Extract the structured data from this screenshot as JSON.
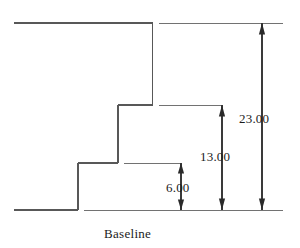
{
  "drawing": {
    "type": "engineering-dimension-drawing",
    "title": "",
    "baseline_label": "Baseline",
    "stroke_color": "#555555",
    "dimension_color": "#333333",
    "text_color": "#1b1b1b",
    "background_color": "#ffffff",
    "dimensions": [
      {
        "id": "dim-23",
        "label": "23.00",
        "value": 23.0,
        "unit": "",
        "orientation": "vertical",
        "from": "baseline",
        "to": "top-face"
      },
      {
        "id": "dim-13",
        "label": "13.00",
        "value": 13.0,
        "unit": "",
        "orientation": "vertical",
        "from": "baseline",
        "to": "upper-step-face"
      },
      {
        "id": "dim-6",
        "label": "6.00",
        "value": 6.0,
        "unit": "",
        "orientation": "vertical",
        "from": "baseline",
        "to": "lower-step-face"
      }
    ],
    "profile": {
      "description": "Stepped staircase profile rising left-to-right from the baseline",
      "steps": [
        {
          "name": "lower-step",
          "height": 6.0
        },
        {
          "name": "upper-step",
          "height": 13.0
        },
        {
          "name": "top-face",
          "height": 23.0
        }
      ]
    }
  }
}
